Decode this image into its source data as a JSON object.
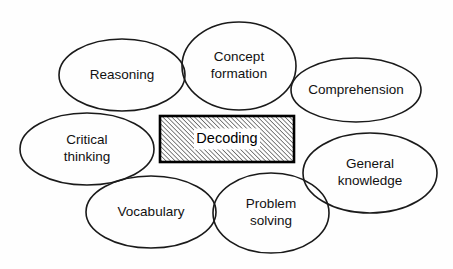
{
  "diagram": {
    "background_color": "#fefefe",
    "line_color": "#1a1a1a",
    "text_color": "#111111",
    "center": {
      "label": "Decoding",
      "shape": "rectangle",
      "fill_pattern": "diagonal-hatch",
      "x": 160,
      "y": 116,
      "width": 134,
      "height": 46
    },
    "nodes": [
      {
        "id": "reasoning",
        "label": "Reasoning",
        "lines": [
          "Reasoning"
        ],
        "cx": 122,
        "cy": 75,
        "rx": 63,
        "ry": 36
      },
      {
        "id": "concept-formation",
        "label": "Concept formation",
        "lines": [
          "Concept",
          "formation"
        ],
        "cx": 239,
        "cy": 66,
        "rx": 57,
        "ry": 44
      },
      {
        "id": "comprehension",
        "label": "Comprehension",
        "lines": [
          "Comprehension"
        ],
        "cx": 356,
        "cy": 90,
        "rx": 65,
        "ry": 32
      },
      {
        "id": "general-knowledge",
        "label": "General knowledge",
        "lines": [
          "General",
          "knowledge"
        ],
        "cx": 370,
        "cy": 173,
        "rx": 67,
        "ry": 40
      },
      {
        "id": "critical-thinking",
        "label": "Critical thinking",
        "lines": [
          "Critical",
          "thinking"
        ],
        "cx": 87,
        "cy": 149,
        "rx": 67,
        "ry": 36
      },
      {
        "id": "vocabulary",
        "label": "Vocabulary",
        "lines": [
          "Vocabulary"
        ],
        "cx": 151,
        "cy": 212,
        "rx": 65,
        "ry": 36
      },
      {
        "id": "problem-solving",
        "label": "Problem solving",
        "lines": [
          "Problem",
          "solving"
        ],
        "cx": 271,
        "cy": 213,
        "rx": 58,
        "ry": 40
      }
    ]
  }
}
